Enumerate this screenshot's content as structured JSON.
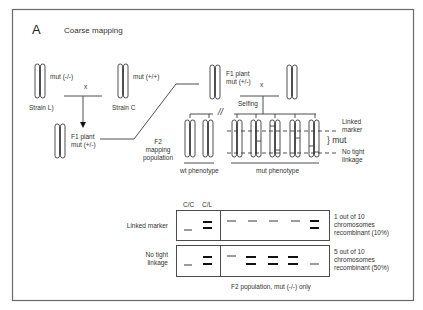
{
  "panel": {
    "letter": "A",
    "title": "Coarse mapping"
  },
  "parents": {
    "strain_l": {
      "genotype": "mut (-/-)",
      "name": "Strain L)"
    },
    "cross_symbol": "x",
    "strain_c": {
      "genotype": "mut (+/+)",
      "name": "Strain C"
    }
  },
  "f1": {
    "label_line1": "F1 plant",
    "label_line2": "mut (+/-)",
    "cross_symbol": "x",
    "selfing": "Selfing"
  },
  "f2": {
    "label_line1": "F2",
    "label_line2": "mapping",
    "label_line3": "population",
    "break_symbol": "//",
    "wt_phenotype": "wt phenotype",
    "mut_phenotype": "mut phenotype",
    "linked_marker_line1": "Linked",
    "linked_marker_line2": "marker",
    "mut_bracket": "} mut",
    "no_tight_line1": "No tight",
    "no_tight_line2": "linkage"
  },
  "gel": {
    "col_cc": "C/C",
    "col_cl": "C/L",
    "rows": [
      {
        "label_line1": "Linked  marker",
        "label_line2": "",
        "result_line1": "1 out of 10",
        "result_line2": "chromosomes",
        "result_line3": "recombinant  (10%)",
        "recombinant_lanes": [
          5
        ]
      },
      {
        "label_line1": "No tight",
        "label_line2": "linkage",
        "result_line1": "5 out of 10",
        "result_line2": "chromosomes",
        "result_line3": "recombinant  (50%)",
        "recombinant_lanes": [
          2,
          3,
          4
        ]
      }
    ],
    "caption": "F2 population,  mut (-/-) only"
  },
  "colors": {
    "line": "#3a3a3a",
    "border": "#6a6a6a",
    "text": "#333333",
    "band": "#111111"
  }
}
